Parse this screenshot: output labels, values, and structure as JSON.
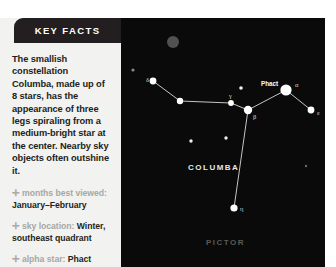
{
  "panel": {
    "header_title": "KEY FACTS",
    "lead_text": "The smallish constellation Columba, made up of 8 stars, has the appearance of three legs spiraling from a medium-bright star at the center. Nearby sky objects often outshine it.",
    "bullet_marker": "✛",
    "facts": [
      {
        "label": "months best viewed:",
        "value": "January–February"
      },
      {
        "label": "sky location:",
        "value": "Winter, southeast quadrant"
      },
      {
        "label": "alpha star:",
        "value": "Phact"
      }
    ]
  },
  "chart": {
    "constellation_label": "COLUMBA",
    "neighbor_label": "PICTOR",
    "alpha_star_name": "Phact",
    "background_color": "#0a0a0a",
    "line_color": "#d9d9d9",
    "star_color": "#ffffff",
    "stars": [
      {
        "id": "delta",
        "greek": "δ",
        "x": 32,
        "y": 63,
        "r": 3.4,
        "label_dx": -7,
        "label_dy": 1
      },
      {
        "id": "mid1",
        "greek": "",
        "x": 59,
        "y": 83,
        "r": 3.2,
        "label_dx": 0,
        "label_dy": 0
      },
      {
        "id": "gamma",
        "greek": "γ",
        "x": 110,
        "y": 85,
        "r": 2.9,
        "label_dx": -2,
        "label_dy": -5
      },
      {
        "id": "beta",
        "greek": "β",
        "x": 127,
        "y": 92,
        "r": 4.2,
        "label_dx": 5,
        "label_dy": 9
      },
      {
        "id": "alpha",
        "greek": "α",
        "x": 165,
        "y": 72,
        "r": 5.6,
        "label_dx": 9,
        "label_dy": -3
      },
      {
        "id": "epsil",
        "greek": "ε",
        "x": 190,
        "y": 92,
        "r": 3.4,
        "label_dx": 6,
        "label_dy": 5
      },
      {
        "id": "eta",
        "greek": "η",
        "x": 113,
        "y": 190,
        "r": 3.6,
        "label_dx": 6,
        "label_dy": 3
      }
    ],
    "lines": [
      [
        "delta",
        "mid1"
      ],
      [
        "mid1",
        "gamma"
      ],
      [
        "gamma",
        "beta"
      ],
      [
        "beta",
        "alpha"
      ],
      [
        "alpha",
        "epsil"
      ],
      [
        "beta",
        "eta"
      ]
    ],
    "field_stars": [
      {
        "x": 12,
        "y": 52,
        "r": 1.6,
        "color": "#8a8a8a"
      },
      {
        "x": 120,
        "y": 70,
        "r": 1.8,
        "color": "#f0f0f0"
      },
      {
        "x": 70,
        "y": 123,
        "r": 1.7,
        "color": "#f0f0f0"
      },
      {
        "x": 105,
        "y": 120,
        "r": 1.7,
        "color": "#f0f0f0"
      },
      {
        "x": 185,
        "y": 148,
        "r": 1.2,
        "color": "#6a6a6a"
      }
    ],
    "nebula": {
      "x": 52,
      "y": 24,
      "r": 6.0,
      "color": "#5e5e5e"
    },
    "alpha_label_pos": {
      "x": 140,
      "y": 68
    },
    "constellation_label_pos": {
      "x": 67,
      "y": 152
    },
    "neighbor_label_pos": {
      "x": 85,
      "y": 227
    }
  }
}
